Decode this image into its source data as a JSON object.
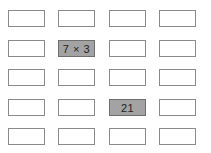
{
  "grid": {
    "rows": 5,
    "cols": 4,
    "cells": [
      [
        "",
        "",
        "",
        ""
      ],
      [
        "",
        "7 × 3",
        "",
        ""
      ],
      [
        "",
        "",
        "",
        ""
      ],
      [
        "",
        "",
        "21",
        ""
      ],
      [
        "",
        "",
        "",
        ""
      ]
    ],
    "highlighted": [
      [
        1,
        1
      ],
      [
        3,
        2
      ]
    ],
    "colors": {
      "cell_fill": "#ffffff",
      "highlight_fill": "#a3a3a3",
      "border": "#8a8a8a"
    }
  }
}
